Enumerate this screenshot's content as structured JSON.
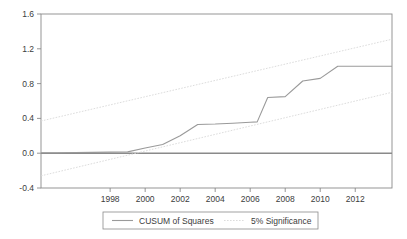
{
  "chart_data": {
    "type": "line",
    "title": "",
    "subtitle": "",
    "xlabel": "",
    "ylabel": "",
    "xlim": [
      1994.05,
      2014.1
    ],
    "ylim": [
      -0.4,
      1.6
    ],
    "grid": false,
    "legend_position": "bottom-center",
    "yticks": [
      "1.6",
      "1.2",
      "0.8",
      "0.4",
      "0.0",
      "-0.4"
    ],
    "ytick_values": [
      1.6,
      1.2,
      0.8,
      0.4,
      0.0,
      -0.4
    ],
    "xticks": [
      "1998",
      "2000",
      "2002",
      "2004",
      "2006",
      "2008",
      "2010",
      "2012"
    ],
    "xtick_values": [
      1998,
      2000,
      2002,
      2004,
      2006,
      2008,
      2010,
      2012
    ],
    "zero_line": 0.0,
    "series": [
      {
        "name": "CUSUM of Squares",
        "color": "#9a9a9a",
        "style": "solid",
        "x": [
          1994.05,
          1995,
          1996,
          1997,
          1998,
          1999,
          2000,
          2001,
          2002,
          2003,
          2004,
          2005,
          2006,
          2006.4,
          2007,
          2008,
          2009,
          2010,
          2011,
          2012,
          2013,
          2014.1
        ],
        "values": [
          0.005,
          0.006,
          0.008,
          0.01,
          0.012,
          0.015,
          0.06,
          0.1,
          0.2,
          0.33,
          0.335,
          0.345,
          0.355,
          0.36,
          0.64,
          0.65,
          0.83,
          0.86,
          1.0,
          1.0,
          1.0,
          1.0
        ]
      },
      {
        "name": "5% Significance",
        "color": "#d0d0d0",
        "style": "dotted",
        "x": [
          1994.05,
          2014.1
        ],
        "values": [
          0.37,
          1.31
        ]
      },
      {
        "name": "5% Significance Lower",
        "color": "#d0d0d0",
        "style": "dotted",
        "x": [
          1994.05,
          2014.1
        ],
        "values": [
          -0.26,
          0.7
        ]
      }
    ],
    "legend": [
      {
        "label": "CUSUM of Squares",
        "color": "#9a9a9a",
        "style": "solid"
      },
      {
        "label": "5% Significance",
        "color": "#d0d0d0",
        "style": "dotted"
      }
    ]
  },
  "axis": {
    "y_tick_0": "1.6",
    "y_tick_1": "1.2",
    "y_tick_2": "0.8",
    "y_tick_3": "0.4",
    "y_tick_4": "0.0",
    "y_tick_5": "-0.4",
    "x_tick_0": "1998",
    "x_tick_1": "2000",
    "x_tick_2": "2002",
    "x_tick_3": "2004",
    "x_tick_4": "2006",
    "x_tick_5": "2008",
    "x_tick_6": "2010",
    "x_tick_7": "2012"
  },
  "legend": {
    "entry_0_label": "CUSUM of Squares",
    "entry_1_label": "5% Significance"
  },
  "colors": {
    "frame": "#8a8a8a",
    "cusum_line": "#9a9a9a",
    "significance_line": "#d8d8d8",
    "zero_line": "#8a8a8a",
    "text": "#3c3c3c",
    "background": "#ffffff"
  }
}
